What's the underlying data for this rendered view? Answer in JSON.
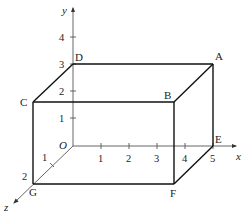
{
  "diagram": {
    "type": "3d-cuboid-on-axes",
    "axes": {
      "x": {
        "label": "x",
        "ticks": [
          "1",
          "2",
          "3",
          "4",
          "5"
        ]
      },
      "y": {
        "label": "y",
        "ticks": [
          "1",
          "2",
          "3",
          "4"
        ]
      },
      "z": {
        "label": "z",
        "ticks": [
          "1",
          "2"
        ]
      },
      "origin_label": "O"
    },
    "vertices": {
      "A": "A",
      "B": "B",
      "C": "C",
      "D": "D",
      "E": "E",
      "F": "F",
      "G": "G"
    },
    "vertex_coords": {
      "O": [
        0,
        0,
        0
      ],
      "A": [
        5,
        3,
        0
      ],
      "B": [
        5,
        3,
        2
      ],
      "C": [
        0,
        3,
        2
      ],
      "D": [
        0,
        3,
        0
      ],
      "E": [
        5,
        0,
        0
      ],
      "F": [
        5,
        0,
        2
      ],
      "G": [
        0,
        0,
        2
      ]
    },
    "edges": [
      [
        "D",
        "A"
      ],
      [
        "C",
        "B"
      ],
      [
        "C",
        "D"
      ],
      [
        "B",
        "A"
      ],
      [
        "C",
        "G"
      ],
      [
        "B",
        "F"
      ],
      [
        "A",
        "E"
      ],
      [
        "G",
        "F"
      ],
      [
        "F",
        "E"
      ]
    ],
    "colors": {
      "edge": "#111111",
      "axis": "#555555",
      "text": "#222222",
      "background": "#ffffff"
    }
  }
}
